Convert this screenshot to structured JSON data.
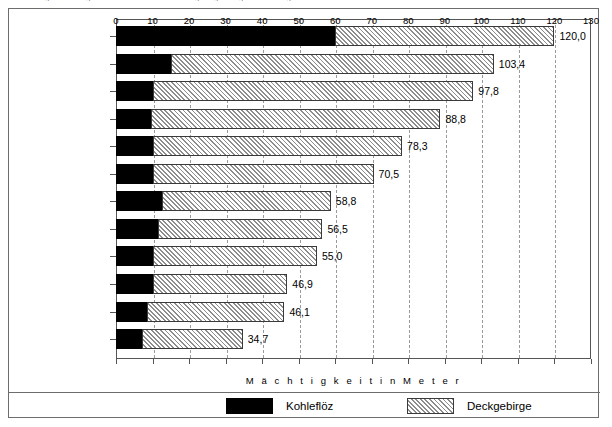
{
  "top_caption": "Abbildung 9: Mächtigkeit von Kohleflöz und Deckgebirge ausgewählter Tagebaue",
  "chart_data": {
    "type": "bar",
    "orientation": "horizontal",
    "stacked": true,
    "title": "",
    "xlabel": "M ä c h t i g k e i t   i n   M e t e r",
    "ylabel": "",
    "xlim": [
      0,
      130
    ],
    "xticks": [
      0,
      10,
      20,
      30,
      40,
      50,
      60,
      70,
      80,
      90,
      100,
      110,
      120,
      130
    ],
    "grid": "vertical-dashed",
    "legend_position": "bottom",
    "categories": [
      "Berzdorf",
      "Welzow-Süd",
      "Nochten",
      "Greifenhain",
      "Klettwitz-Nord",
      "Meuro",
      "Reichwalde",
      "Jänschwalde",
      "Bärwalde",
      "Scheibe",
      "Cottbus-Nord",
      "Seese-Ost"
    ],
    "series": [
      {
        "name": "Kohleflöz",
        "color": "#000000",
        "fill": "solid-black",
        "values": [
          60.0,
          15.0,
          10.0,
          9.5,
          10.0,
          10.0,
          12.5,
          11.5,
          10.0,
          10.0,
          8.5,
          7.0
        ]
      },
      {
        "name": "Deckgebirge",
        "color": "#d2d2d2",
        "fill": "diagonal-hatch",
        "values": [
          60.0,
          88.4,
          87.8,
          79.3,
          68.3,
          60.5,
          46.3,
          45.0,
          45.0,
          36.9,
          37.6,
          27.7
        ]
      }
    ],
    "totals": [
      120.0,
      103.4,
      97.8,
      88.8,
      78.3,
      70.5,
      58.8,
      56.5,
      55.0,
      46.9,
      46.1,
      34.7
    ],
    "total_labels": [
      "120,0",
      "103,4",
      "97,8",
      "88,8",
      "78,3",
      "70,5",
      "58,8",
      "56,5",
      "55,0",
      "46,9",
      "46,1",
      "34,7"
    ]
  },
  "legend": {
    "items": [
      {
        "label": "Kohleflöz",
        "swatch": "solid-black-swatch"
      },
      {
        "label": "Deckgebirge",
        "swatch": "hatched-swatch"
      }
    ]
  }
}
